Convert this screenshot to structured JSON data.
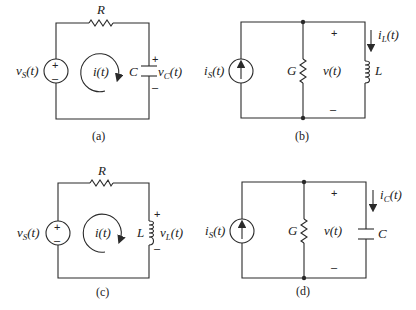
{
  "figure": {
    "panels": [
      {
        "id": "a",
        "caption": "(a)",
        "type": "series RC circuit",
        "source": {
          "kind": "voltage",
          "label": "v",
          "sub": "S",
          "arg": "(t)",
          "plus": "+",
          "minus": "–"
        },
        "resistor": {
          "label": "R"
        },
        "loop_current": {
          "label": "i(t)"
        },
        "element": {
          "kind": "capacitor",
          "label": "C",
          "voltage_label": "v",
          "voltage_sub": "C",
          "voltage_arg": "(t)",
          "plus": "+",
          "minus": "–"
        }
      },
      {
        "id": "b",
        "caption": "(b)",
        "type": "parallel GL circuit",
        "source": {
          "kind": "current",
          "label": "i",
          "sub": "S",
          "arg": "(t)"
        },
        "conductance": {
          "label": "G"
        },
        "voltage": {
          "label": "v(t)",
          "plus": "+",
          "minus": "–"
        },
        "element": {
          "kind": "inductor",
          "label": "L",
          "current_label": "i",
          "current_sub": "L",
          "current_arg": "(t)"
        }
      },
      {
        "id": "c",
        "caption": "(c)",
        "type": "series RL circuit",
        "source": {
          "kind": "voltage",
          "label": "v",
          "sub": "S",
          "arg": "(t)",
          "plus": "+",
          "minus": "–"
        },
        "resistor": {
          "label": "R"
        },
        "loop_current": {
          "label": "i(t)"
        },
        "element": {
          "kind": "inductor",
          "label": "L",
          "voltage_label": "v",
          "voltage_sub": "L",
          "voltage_arg": "(t)",
          "plus": "+",
          "minus": "–"
        }
      },
      {
        "id": "d",
        "caption": "(d)",
        "type": "parallel GC circuit",
        "source": {
          "kind": "current",
          "label": "i",
          "sub": "S",
          "arg": "(t)"
        },
        "conductance": {
          "label": "G"
        },
        "voltage": {
          "label": "v(t)",
          "plus": "+",
          "minus": "–"
        },
        "element": {
          "kind": "capacitor",
          "label": "C",
          "current_label": "i",
          "current_sub": "C",
          "current_arg": "(t)"
        }
      }
    ],
    "colors": {
      "ink": "#2a2a2a",
      "background": "#ffffff"
    }
  }
}
